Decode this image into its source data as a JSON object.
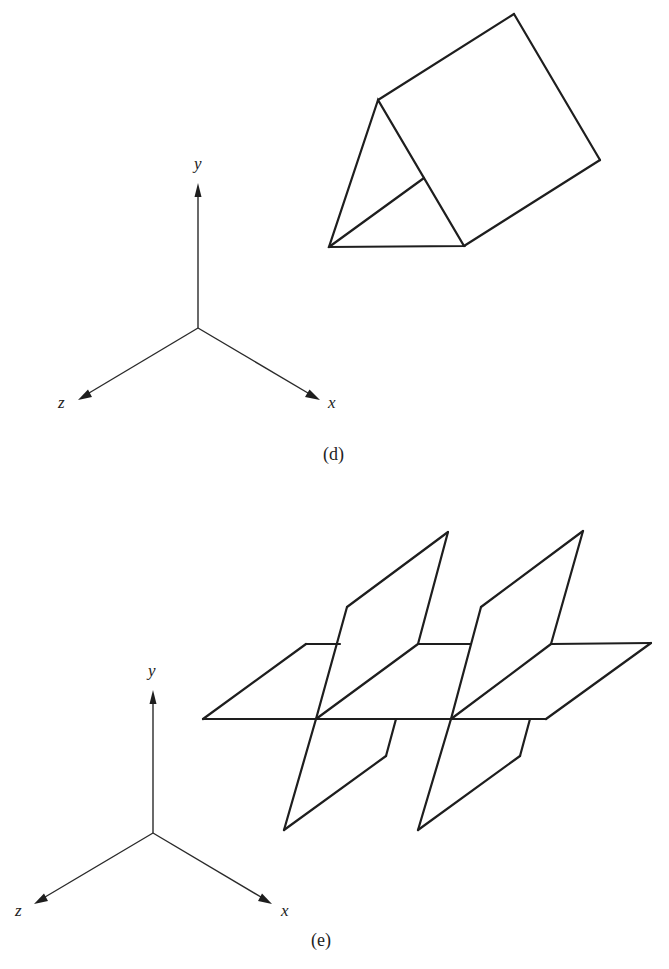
{
  "figure": {
    "type": "technical-drawing",
    "colors": {
      "background": "#ffffff",
      "lines": "#1e1e1e"
    },
    "panels": [
      {
        "id": "d",
        "caption": "(d)",
        "object": "triangular-prism",
        "axes": {
          "y_label": "y",
          "x_label": "x",
          "z_label": "z"
        }
      },
      {
        "id": "e",
        "caption": "(e)",
        "object": "intersecting-planes",
        "axes": {
          "y_label": "y",
          "x_label": "x",
          "z_label": "z"
        }
      }
    ]
  }
}
